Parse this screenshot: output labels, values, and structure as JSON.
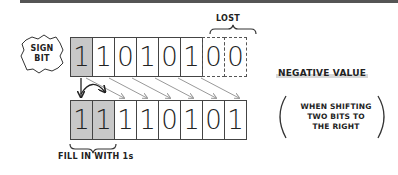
{
  "diagram": {
    "sign_badge": {
      "line1": "SIGN",
      "line2": "BIT"
    },
    "lost_label": "LOST",
    "fill_label": "FILL IN WITH 1s",
    "negative_label": "NEGATIVE VALUE",
    "note": {
      "line1": "WHEN SHIFTING",
      "line2": "TWO BITS TO",
      "line3": "THE RIGHT"
    },
    "top_row": {
      "bits": [
        "1",
        "1",
        "0",
        "1",
        "0",
        "1",
        "0",
        "0"
      ],
      "shaded_indices": [
        0
      ],
      "lost_indices": [
        6,
        7
      ]
    },
    "bottom_row": {
      "bits": [
        "1",
        "1",
        "1",
        "1",
        "0",
        "1",
        "0",
        "1"
      ],
      "shaded_indices": [
        0,
        1
      ]
    },
    "colors": {
      "shade": "#c8c8c8",
      "line": "#444444",
      "arrow": "#999999",
      "bar": "#555555"
    }
  }
}
